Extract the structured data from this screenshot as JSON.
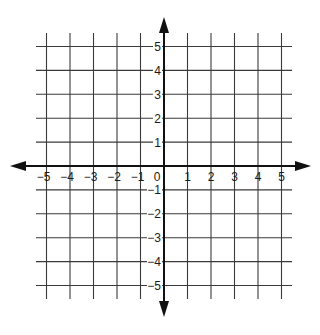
{
  "diagram": {
    "type": "coordinate-plane",
    "x_axis": {
      "min": -5,
      "max": 5,
      "tick_labels": [
        "-5",
        "-4",
        "-3",
        "-2",
        "-1",
        "0",
        "1",
        "2",
        "3",
        "4",
        "5"
      ],
      "arrows": "both"
    },
    "y_axis": {
      "min": -5,
      "max": 5,
      "tick_labels": [
        "5",
        "4",
        "3",
        "2",
        "1",
        "-1",
        "-2",
        "-3",
        "-4",
        "-5"
      ],
      "arrows": "both"
    },
    "origin_label": "0",
    "grid": true,
    "colors": {
      "background": "#ffffff",
      "grid": "#3a3a3a",
      "axis": "#111111",
      "text": "#1a1a1a"
    }
  }
}
